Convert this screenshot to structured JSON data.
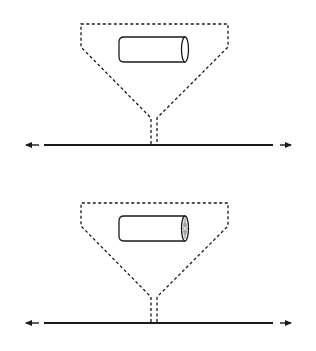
{
  "diagram": {
    "width": 316,
    "height": 351,
    "background": "#ffffff",
    "stroke_color": "#1a1a1a",
    "panels": [
      {
        "id": "top",
        "funnel": {
          "top_y": 24,
          "left_x": 81,
          "right_x": 228,
          "shoulder_y": 47,
          "neck_y": 118,
          "neck_left_x": 151,
          "neck_right_x": 157,
          "stem_bottom_y": 144
        },
        "cylinder": {
          "left_x": 119,
          "right_x": 185,
          "top_y": 37,
          "bottom_y": 62,
          "end_cap": "plain"
        },
        "track": {
          "y": 145,
          "line_x1": 44,
          "line_x2": 273,
          "arrow_left": {
            "x1": 39,
            "x2": 20
          },
          "arrow_right": {
            "x1": 280,
            "x2": 297
          }
        }
      },
      {
        "id": "bottom",
        "funnel": {
          "top_y": 203,
          "left_x": 81,
          "right_x": 228,
          "shoulder_y": 226,
          "neck_y": 297,
          "neck_left_x": 151,
          "neck_right_x": 157,
          "stem_bottom_y": 322
        },
        "cylinder": {
          "left_x": 119,
          "right_x": 185,
          "top_y": 216,
          "bottom_y": 241,
          "end_cap": "segmented"
        },
        "track": {
          "y": 323,
          "line_x1": 44,
          "line_x2": 273,
          "arrow_left": {
            "x1": 39,
            "x2": 20
          },
          "arrow_right": {
            "x1": 280,
            "x2": 297
          }
        }
      }
    ]
  }
}
